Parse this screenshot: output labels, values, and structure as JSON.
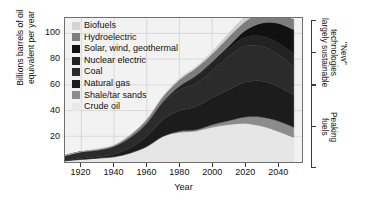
{
  "chart_data": {
    "type": "area",
    "title": "",
    "xlabel": "Year",
    "ylabel": "Billions barrels of oil\nequivalent per year",
    "xlim": [
      1910,
      2055
    ],
    "ylim": [
      0,
      112
    ],
    "xticks": [
      1920,
      1940,
      1960,
      1980,
      2000,
      2020,
      2040
    ],
    "yticks": [
      20,
      40,
      60,
      80,
      100
    ],
    "grid": true,
    "legend_position": "top-left",
    "stack_order_bottom_to_top": [
      "Crude oil",
      "Shale/tar sands",
      "Natural gas",
      "Coal",
      "Nuclear electric",
      "Solar, wind, geothermal",
      "Hydroelectric",
      "Biofuels"
    ],
    "x": [
      1910,
      1920,
      1930,
      1940,
      1950,
      1960,
      1970,
      1980,
      1990,
      2000,
      2010,
      2020,
      2030,
      2040,
      2050
    ],
    "series": [
      {
        "name": "Crude oil",
        "color": "#e6e6e6",
        "values": [
          1,
          2,
          3,
          4,
          7,
          12,
          20,
          23,
          24,
          27,
          29,
          30,
          28,
          24,
          19
        ]
      },
      {
        "name": "Shale/tar sands",
        "color": "#8c8c8c",
        "values": [
          0,
          0,
          0,
          0,
          0,
          0,
          0,
          1,
          1,
          2,
          3,
          5,
          7,
          8,
          8
        ]
      },
      {
        "name": "Natural gas",
        "color": "#1c1c1c",
        "values": [
          0,
          1,
          1,
          2,
          4,
          8,
          13,
          16,
          18,
          21,
          24,
          27,
          28,
          27,
          25
        ]
      },
      {
        "name": "Coal",
        "color": "#2b2b2b",
        "values": [
          4,
          5,
          5,
          6,
          8,
          10,
          13,
          16,
          18,
          21,
          26,
          28,
          27,
          25,
          22
        ]
      },
      {
        "name": "Nuclear electric",
        "color": "#232323",
        "values": [
          0,
          0,
          0,
          0,
          0,
          0,
          1,
          3,
          5,
          6,
          6,
          7,
          8,
          9,
          10
        ]
      },
      {
        "name": "Solar, wind, geothermal",
        "color": "#111111",
        "values": [
          0,
          0,
          0,
          0,
          0,
          0,
          0,
          0,
          1,
          1,
          2,
          5,
          10,
          15,
          19
        ]
      },
      {
        "name": "Hydroelectric",
        "color": "#7d7d7d",
        "values": [
          0,
          0,
          1,
          1,
          2,
          3,
          4,
          5,
          6,
          6,
          7,
          7,
          8,
          8,
          8
        ]
      },
      {
        "name": "Biofuels",
        "color": "#cfcfcf",
        "values": [
          0,
          0,
          0,
          0,
          0,
          0,
          0,
          1,
          1,
          2,
          3,
          4,
          5,
          6,
          6
        ]
      }
    ],
    "annotations": [
      {
        "id": "bracket-upper",
        "text": "\"New\" technologies\nlargely sustainable"
      },
      {
        "id": "bracket-lower",
        "text": "Peaking\nfuels"
      }
    ]
  },
  "legend": {
    "items": [
      {
        "label": "Biofuels",
        "color": "#d4d4d4"
      },
      {
        "label": "Hydroelectric",
        "color": "#7d7d7d"
      },
      {
        "label": "Solar, wind, geothermal",
        "color": "#111111"
      },
      {
        "label": "Nuclear electric",
        "color": "#232323"
      },
      {
        "label": "Coal",
        "color": "#2b2b2b"
      },
      {
        "label": "Natural gas",
        "color": "#1c1c1c"
      },
      {
        "label": "Shale/tar sands",
        "color": "#8c8c8c"
      },
      {
        "label": "Crude oil",
        "color": "#e8e8e8"
      }
    ]
  },
  "axes": {
    "y_title": "Billions barrels of oil\nequivalent per year",
    "x_title": "Year",
    "y_ticks": [
      "20",
      "40",
      "60",
      "80",
      "100"
    ],
    "x_ticks": [
      "1920",
      "1940",
      "1960",
      "1980",
      "2000",
      "2020",
      "2040"
    ]
  },
  "brackets": {
    "upper": "\"New\" technologies\nlargely sustainable",
    "lower": "Peaking\nfuels"
  }
}
